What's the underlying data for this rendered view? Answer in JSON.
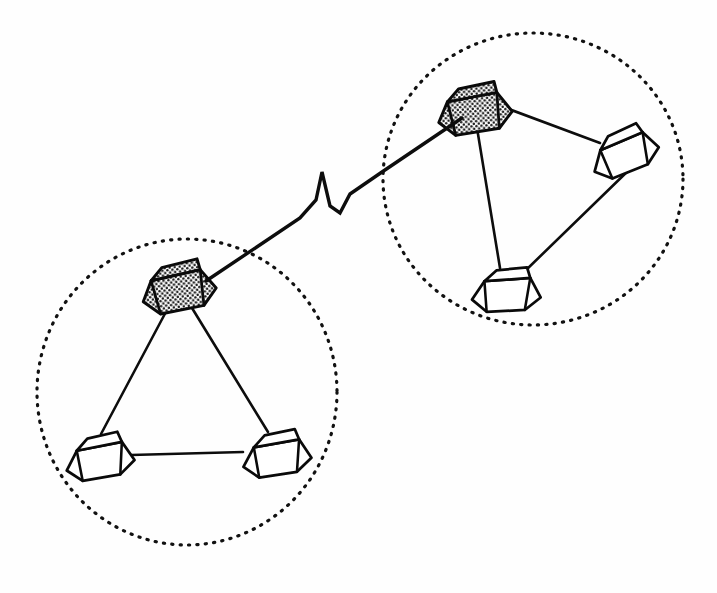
{
  "diagram": {
    "type": "network-topology",
    "background_color": "#fefefe",
    "line_color": "#0d0d0d",
    "canvas": {
      "width": 717,
      "height": 593
    }
  },
  "clusters": [
    {
      "id": "cluster-right",
      "label": "Remote site network segment",
      "boundary": {
        "shape": "ellipse",
        "style": "dotted",
        "cx": 533,
        "cy": 179,
        "rx": 150,
        "ry": 146,
        "stroke_color": "#111111"
      },
      "nodes": [
        {
          "id": "node-right-server",
          "role": "server",
          "fill": "shaded",
          "fill_color": "#d9d9d9",
          "x": 474,
          "y": 110,
          "scale": 1.0,
          "rotation": -4
        },
        {
          "id": "node-right-east",
          "role": "workstation",
          "fill": "plain",
          "fill_color": "#ffffff",
          "x": 622,
          "y": 150,
          "scale": 0.95,
          "rotation": -16
        },
        {
          "id": "node-right-south",
          "role": "workstation",
          "fill": "plain",
          "fill_color": "#ffffff",
          "x": 505,
          "y": 288,
          "scale": 0.95,
          "rotation": 3
        }
      ],
      "links": [
        {
          "from": "node-right-server",
          "to": "node-right-east"
        },
        {
          "from": "node-right-server",
          "to": "node-right-south"
        },
        {
          "from": "node-right-east",
          "to": "node-right-south"
        }
      ]
    },
    {
      "id": "cluster-left",
      "label": "Local site network segment",
      "boundary": {
        "shape": "ellipse",
        "style": "dotted",
        "cx": 187,
        "cy": 392,
        "rx": 150,
        "ry": 153,
        "stroke_color": "#111111"
      },
      "nodes": [
        {
          "id": "node-left-server",
          "role": "server",
          "fill": "shaded",
          "fill_color": "#d9d9d9",
          "x": 178,
          "y": 288,
          "scale": 1.0,
          "rotation": -6
        },
        {
          "id": "node-left-southwest",
          "role": "workstation",
          "fill": "plain",
          "fill_color": "#ffffff",
          "x": 98,
          "y": 455,
          "scale": 0.95,
          "rotation": -4
        },
        {
          "id": "node-left-southeast",
          "role": "workstation",
          "fill": "plain",
          "fill_color": "#ffffff",
          "x": 275,
          "y": 452,
          "scale": 0.95,
          "rotation": -3
        }
      ],
      "links": [
        {
          "from": "node-left-server",
          "to": "node-left-southwest"
        },
        {
          "from": "node-left-server",
          "to": "node-left-southeast"
        },
        {
          "from": "node-left-southwest",
          "to": "node-left-southeast"
        }
      ]
    }
  ],
  "wan_link": {
    "id": "wan-interconnect",
    "label": "Wide area link with break symbol",
    "from": "node-left-server",
    "to": "node-right-server",
    "break_symbol": "lightning-bolt",
    "path": "M 206 281 L 300 218 L 316 200 L 322 172 L 330 206 L 340 213 L 350 194 L 382 172 L 462 118",
    "stroke_color": "#0d0d0d",
    "stroke_width": 3.4
  },
  "legend": {
    "shaded_node_meaning": "server / gateway",
    "plain_node_meaning": "workstation",
    "dotted_circle_meaning": "network segment boundary",
    "zigzag_meaning": "long-distance link"
  }
}
